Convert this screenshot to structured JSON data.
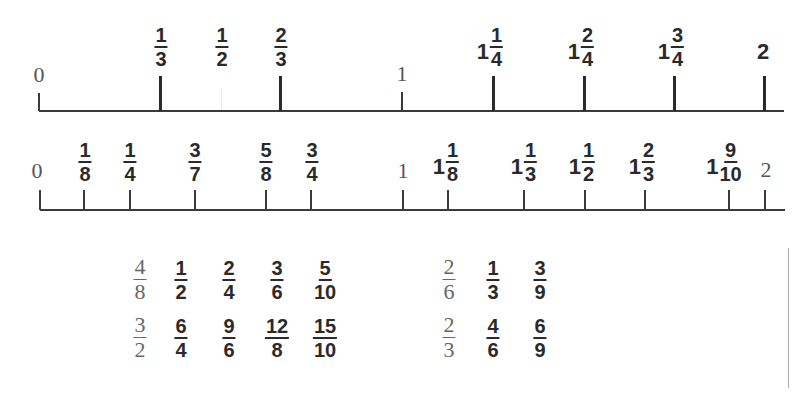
{
  "number_line_1": {
    "range": [
      0,
      2
    ],
    "end_labels": {
      "zero": "0",
      "one": "1"
    },
    "marks": [
      {
        "value": 0.3333,
        "type": "fraction",
        "num": "1",
        "den": "3",
        "tick": "thick"
      },
      {
        "value": 0.5,
        "type": "fraction",
        "num": "1",
        "den": "2",
        "tick": "faint"
      },
      {
        "value": 0.6667,
        "type": "fraction",
        "num": "2",
        "den": "3",
        "tick": "thick"
      },
      {
        "value": 1.25,
        "type": "mixed",
        "whole": "1",
        "num": "1",
        "den": "4",
        "tick": "thick"
      },
      {
        "value": 1.5,
        "type": "mixed",
        "whole": "1",
        "num": "2",
        "den": "4",
        "tick": "thick"
      },
      {
        "value": 1.75,
        "type": "mixed",
        "whole": "1",
        "num": "3",
        "den": "4",
        "tick": "thick"
      },
      {
        "value": 2,
        "type": "whole",
        "label": "2",
        "tick": "thick"
      }
    ]
  },
  "number_line_2": {
    "range": [
      0,
      2
    ],
    "end_labels": {
      "zero": "0",
      "one": "1",
      "two": "2"
    },
    "marks": [
      {
        "value": 0.125,
        "type": "fraction",
        "num": "1",
        "den": "8"
      },
      {
        "value": 0.25,
        "type": "fraction",
        "num": "1",
        "den": "4"
      },
      {
        "value": 0.4286,
        "type": "fraction",
        "num": "3",
        "den": "7"
      },
      {
        "value": 0.625,
        "type": "fraction",
        "num": "5",
        "den": "8"
      },
      {
        "value": 0.75,
        "type": "fraction",
        "num": "3",
        "den": "4"
      },
      {
        "value": 1.125,
        "type": "mixed",
        "whole": "1",
        "num": "1",
        "den": "8"
      },
      {
        "value": 1.3333,
        "type": "mixed",
        "whole": "1",
        "num": "1",
        "den": "3"
      },
      {
        "value": 1.5,
        "type": "mixed",
        "whole": "1",
        "num": "1",
        "den": "2"
      },
      {
        "value": 1.6667,
        "type": "mixed",
        "whole": "1",
        "num": "2",
        "den": "3"
      },
      {
        "value": 1.9,
        "type": "mixed",
        "whole": "1",
        "num": "9",
        "den": "10"
      }
    ]
  },
  "equivalent_fractions": {
    "group_a": {
      "row1": {
        "given": {
          "num": "4",
          "den": "8"
        },
        "equivalents": [
          {
            "num": "1",
            "den": "2"
          },
          {
            "num": "2",
            "den": "4"
          },
          {
            "num": "3",
            "den": "6"
          },
          {
            "num": "5",
            "den": "10"
          }
        ]
      },
      "row2": {
        "given": {
          "num": "3",
          "den": "2"
        },
        "equivalents": [
          {
            "num": "6",
            "den": "4"
          },
          {
            "num": "9",
            "den": "6"
          },
          {
            "num": "12",
            "den": "8"
          },
          {
            "num": "15",
            "den": "10"
          }
        ]
      }
    },
    "group_b": {
      "row1": {
        "given": {
          "num": "2",
          "den": "6"
        },
        "equivalents": [
          {
            "num": "1",
            "den": "3"
          },
          {
            "num": "3",
            "den": "9"
          }
        ]
      },
      "row2": {
        "given": {
          "num": "2",
          "den": "3"
        },
        "equivalents": [
          {
            "num": "4",
            "den": "6"
          },
          {
            "num": "6",
            "den": "9"
          }
        ]
      }
    }
  }
}
